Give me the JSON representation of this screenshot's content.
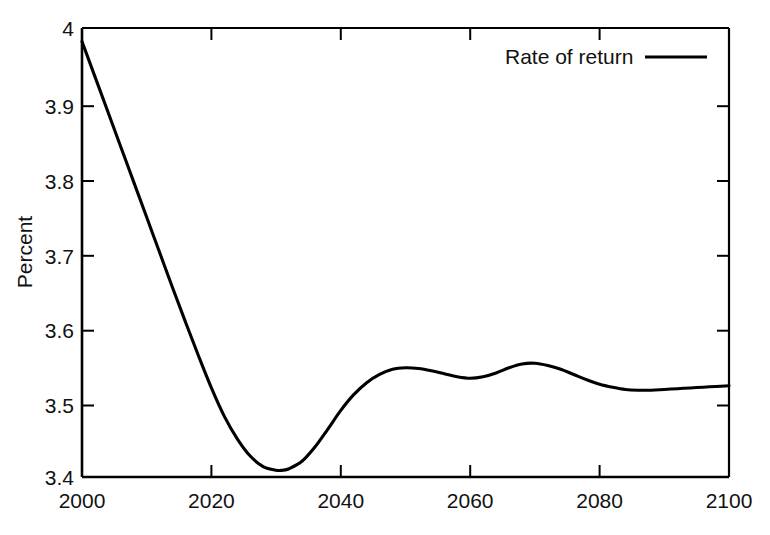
{
  "chart_data": {
    "type": "line",
    "title": "",
    "xlabel": "",
    "ylabel": "Percent",
    "xlim": [
      2000,
      2100
    ],
    "ylim": [
      3.4,
      4.0
    ],
    "grid": false,
    "legend_position": "top-right",
    "x_ticks": [
      "2000",
      "2020",
      "2040",
      "2060",
      "2080",
      "2100"
    ],
    "x_tick_values": [
      2000,
      2020,
      2040,
      2060,
      2080,
      2100
    ],
    "y_ticks": [
      "3.4",
      "3.5",
      "3.6",
      "3.7",
      "3.8",
      "3.9",
      "4"
    ],
    "y_tick_values": [
      3.4,
      3.5,
      3.6,
      3.7,
      3.8,
      3.9,
      4.0
    ],
    "series": [
      {
        "name": "Rate of return",
        "color": "#000000",
        "x": [
          2000,
          2002,
          2004,
          2006,
          2008,
          2010,
          2012,
          2014,
          2016,
          2018,
          2020,
          2022,
          2024,
          2026,
          2028,
          2030,
          2031,
          2032,
          2034,
          2036,
          2038,
          2040,
          2042,
          2044,
          2046,
          2048,
          2050,
          2052,
          2054,
          2056,
          2058,
          2060,
          2062,
          2064,
          2066,
          2068,
          2070,
          2072,
          2074,
          2076,
          2078,
          2080,
          2082,
          2084,
          2086,
          2088,
          2090,
          2092,
          2094,
          2096,
          2098,
          2100
        ],
        "y": [
          3.982,
          3.935,
          3.888,
          3.841,
          3.794,
          3.747,
          3.7,
          3.653,
          3.607,
          3.562,
          3.519,
          3.481,
          3.451,
          3.428,
          3.414,
          3.409,
          3.409,
          3.411,
          3.421,
          3.44,
          3.464,
          3.489,
          3.51,
          3.526,
          3.537,
          3.544,
          3.546,
          3.545,
          3.542,
          3.538,
          3.534,
          3.532,
          3.534,
          3.539,
          3.546,
          3.551,
          3.552,
          3.549,
          3.544,
          3.537,
          3.53,
          3.524,
          3.52,
          3.517,
          3.516,
          3.516,
          3.517,
          3.518,
          3.519,
          3.52,
          3.521,
          3.522
        ]
      }
    ],
    "annotations": {
      "minimum": {
        "x": 2031,
        "y": 3.409
      },
      "start": {
        "x": 2000,
        "y": 3.982
      },
      "end": {
        "x": 2100,
        "y": 3.522
      },
      "local_max_1": {
        "x": 2050,
        "y": 3.546
      },
      "local_min_1": {
        "x": 2060,
        "y": 3.532
      },
      "local_max_2": {
        "x": 2070,
        "y": 3.552
      },
      "local_min_2": {
        "x": 2087,
        "y": 3.516
      }
    }
  },
  "legend": {
    "entries": [
      {
        "label": "Rate of return",
        "color": "#000000"
      }
    ]
  },
  "axes": {
    "y_label": "Percent"
  },
  "colors": {
    "line": "#000000",
    "axis": "#000000",
    "background": "#ffffff"
  }
}
